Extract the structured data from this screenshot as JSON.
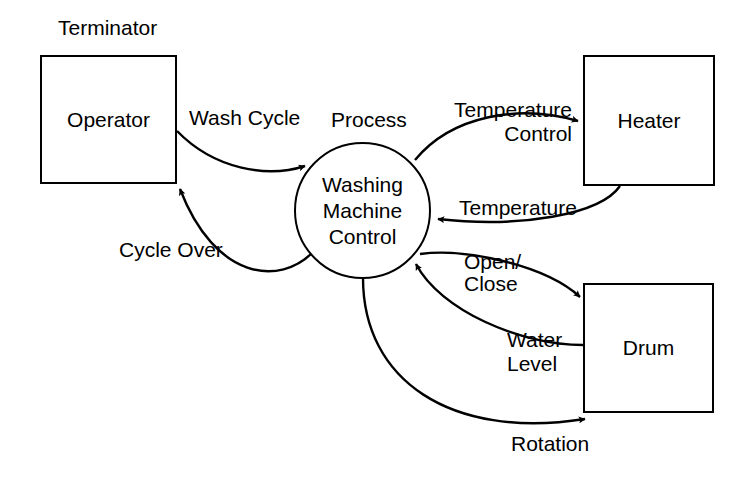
{
  "diagram": {
    "stroke_color": "#000000",
    "background_color": "#ffffff",
    "annotations": [
      {
        "id": "terminator-annotation",
        "text": "Terminator"
      },
      {
        "id": "process-annotation",
        "text": "Process"
      }
    ],
    "nodes": [
      {
        "id": "operator",
        "type": "terminator",
        "label": "Operator"
      },
      {
        "id": "heater",
        "type": "terminator",
        "label": "Heater"
      },
      {
        "id": "drum",
        "type": "terminator",
        "label": "Drum"
      },
      {
        "id": "washing-machine-control",
        "type": "process",
        "label": "Washing\nMachine\nControl"
      }
    ],
    "flows": [
      {
        "id": "wash-cycle",
        "label": "Wash Cycle",
        "from": "operator",
        "to": "washing-machine-control"
      },
      {
        "id": "cycle-over",
        "label": "Cycle Over",
        "from": "washing-machine-control",
        "to": "operator"
      },
      {
        "id": "temperature-control",
        "label_line1": "Temperature",
        "label_line2": "Control",
        "from": "washing-machine-control",
        "to": "heater"
      },
      {
        "id": "temperature",
        "label": "Temperature",
        "from": "heater",
        "to": "washing-machine-control"
      },
      {
        "id": "open-close",
        "label_line1": "Open/",
        "label_line2": "Close",
        "from": "washing-machine-control",
        "to": "drum"
      },
      {
        "id": "water-level",
        "label_line1": "Water",
        "label_line2": "Level",
        "from": "drum",
        "to": "washing-machine-control"
      },
      {
        "id": "rotation",
        "label": "Rotation",
        "from": "washing-machine-control",
        "to": "drum"
      }
    ]
  }
}
